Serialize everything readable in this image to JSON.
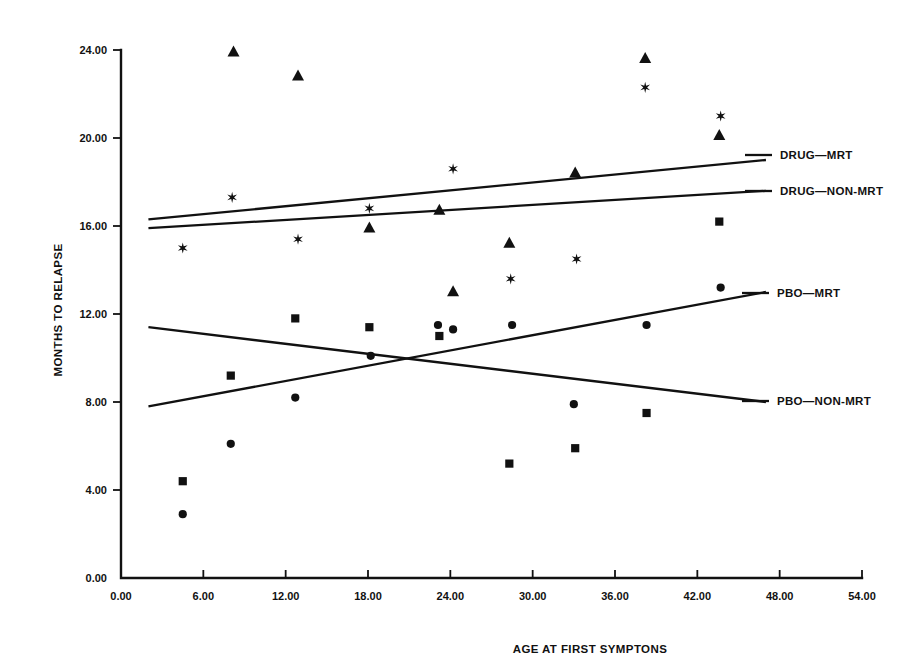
{
  "chart_data": {
    "type": "scatter",
    "title": "",
    "xlabel": "AGE AT FIRST SYMPTONS",
    "ylabel": "MONTHS TO RELAPSE",
    "xlim": [
      0,
      54
    ],
    "ylim": [
      0,
      24
    ],
    "grid": false,
    "legend_position": "right",
    "xticks": [
      "0.00",
      "6.00",
      "12.00",
      "18.00",
      "24.00",
      "30.00",
      "36.00",
      "42.00",
      "48.00",
      "54.00"
    ],
    "xtick_values": [
      0,
      6,
      12,
      18,
      24,
      30,
      36,
      42,
      48,
      54
    ],
    "yticks": [
      "0.00",
      "4.00",
      "8.00",
      "12.00",
      "16.00",
      "20.00",
      "24.00"
    ],
    "ytick_values": [
      0,
      4,
      8,
      12,
      16,
      20,
      24
    ],
    "series": [
      {
        "name": "DRUG-MRT",
        "marker": "triangle",
        "points": [
          {
            "x": 8.2,
            "y": 23.9
          },
          {
            "x": 12.9,
            "y": 22.8
          },
          {
            "x": 18.1,
            "y": 15.9
          },
          {
            "x": 23.2,
            "y": 16.7
          },
          {
            "x": 24.2,
            "y": 13.0
          },
          {
            "x": 28.3,
            "y": 15.2
          },
          {
            "x": 33.1,
            "y": 18.4
          },
          {
            "x": 38.2,
            "y": 23.6
          },
          {
            "x": 43.6,
            "y": 20.1
          }
        ],
        "fit_line": {
          "x1": 2.0,
          "y1": 16.3,
          "x2": 47.0,
          "y2": 19.0
        }
      },
      {
        "name": "DRUG-NON-MRT",
        "marker": "asterisk",
        "points": [
          {
            "x": 4.5,
            "y": 15.0
          },
          {
            "x": 8.1,
            "y": 17.3
          },
          {
            "x": 12.9,
            "y": 15.4
          },
          {
            "x": 18.1,
            "y": 16.8
          },
          {
            "x": 24.2,
            "y": 18.6
          },
          {
            "x": 28.4,
            "y": 13.6
          },
          {
            "x": 33.2,
            "y": 14.5
          },
          {
            "x": 38.2,
            "y": 22.3
          },
          {
            "x": 43.7,
            "y": 21.0
          }
        ],
        "fit_line": {
          "x1": 2.0,
          "y1": 15.9,
          "x2": 47.0,
          "y2": 17.6
        }
      },
      {
        "name": "PBO-MRT",
        "marker": "circle",
        "points": [
          {
            "x": 4.5,
            "y": 2.9
          },
          {
            "x": 8.0,
            "y": 6.1
          },
          {
            "x": 12.7,
            "y": 8.2
          },
          {
            "x": 18.2,
            "y": 10.1
          },
          {
            "x": 23.1,
            "y": 11.5
          },
          {
            "x": 24.2,
            "y": 11.3
          },
          {
            "x": 28.5,
            "y": 11.5
          },
          {
            "x": 33.0,
            "y": 7.9
          },
          {
            "x": 38.3,
            "y": 11.5
          },
          {
            "x": 43.7,
            "y": 13.2
          }
        ],
        "fit_line": {
          "x1": 2.0,
          "y1": 7.8,
          "x2": 47.0,
          "y2": 13.0
        }
      },
      {
        "name": "PBO-NON-MRT",
        "marker": "square",
        "points": [
          {
            "x": 4.5,
            "y": 4.4
          },
          {
            "x": 8.0,
            "y": 9.2
          },
          {
            "x": 12.7,
            "y": 11.8
          },
          {
            "x": 18.1,
            "y": 11.4
          },
          {
            "x": 23.2,
            "y": 11.0
          },
          {
            "x": 28.3,
            "y": 5.2
          },
          {
            "x": 33.1,
            "y": 5.9
          },
          {
            "x": 38.3,
            "y": 7.5
          },
          {
            "x": 43.6,
            "y": 16.2
          }
        ],
        "fit_line": {
          "x1": 2.0,
          "y1": 11.4,
          "x2": 47.0,
          "y2": 8.0
        }
      }
    ],
    "legend": [
      {
        "label": "DRUG—MRT",
        "marker": "triangle"
      },
      {
        "label": "DRUG—NON-MRT",
        "marker": "asterisk"
      },
      {
        "label": "PBO—MRT",
        "marker": "circle"
      },
      {
        "label": "PBO—NON-MRT",
        "marker": "square"
      }
    ],
    "colors": {
      "ink": "#111111",
      "background": "#ffffff"
    }
  }
}
